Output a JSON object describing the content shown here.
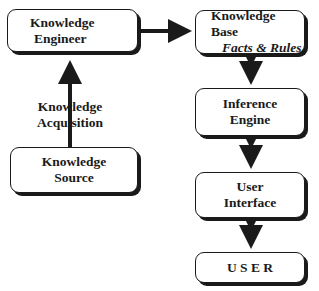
{
  "diagram": {
    "nodes": {
      "knowledge_engineer": {
        "line1": "Knowledge",
        "line2": "Engineer"
      },
      "knowledge_base": {
        "line1": "Knowledge Base",
        "line2": "Facts & Rules"
      },
      "inference_engine": {
        "line1": "Inference",
        "line2": "Engine"
      },
      "user_interface": {
        "line1": "User",
        "line2": "Interface"
      },
      "user": {
        "line1": "U S E R"
      },
      "knowledge_source": {
        "line1": "Knowledge",
        "line2": "Source"
      }
    },
    "edges": {
      "acquisition_label": {
        "line1": "Knowledge",
        "line2": "Acquisition"
      }
    },
    "colors": {
      "stroke": "#1a1a1a",
      "fill": "#ffffff"
    }
  }
}
